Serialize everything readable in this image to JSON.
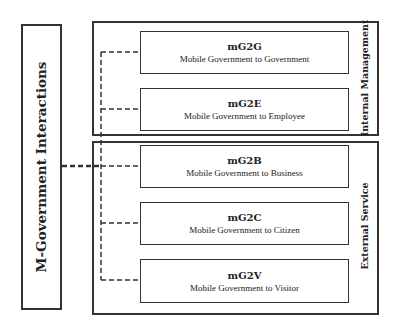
{
  "root": {
    "label": "M-Government Interactions"
  },
  "groups": [
    {
      "label": "Internal Management"
    },
    {
      "label": "External Service"
    }
  ],
  "nodes": [
    {
      "code": "mG2G",
      "desc": "Mobile Government to Government"
    },
    {
      "code": "mG2E",
      "desc": "Mobile Government to Employee"
    },
    {
      "code": "mG2B",
      "desc": "Mobile Government to Business"
    },
    {
      "code": "mG2C",
      "desc": "Mobile Government to Citizen"
    },
    {
      "code": "mG2V",
      "desc": "Mobile Government to Visitor"
    }
  ]
}
